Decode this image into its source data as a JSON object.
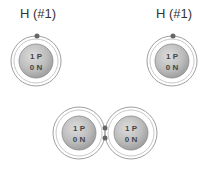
{
  "atoms": [
    {
      "label": "H (#1)",
      "protons": "1 P",
      "neutrons": "0 N"
    },
    {
      "label": "H (#1)",
      "protons": "1 P",
      "neutrons": "0 N"
    }
  ],
  "molecule": {
    "atoms": [
      {
        "protons": "1 P",
        "neutrons": "0 N"
      },
      {
        "protons": "1 P",
        "neutrons": "0 N"
      }
    ]
  },
  "colors": {
    "nucleus": "#b8b8b8",
    "orbit": "#999999",
    "electron": "#666666"
  }
}
